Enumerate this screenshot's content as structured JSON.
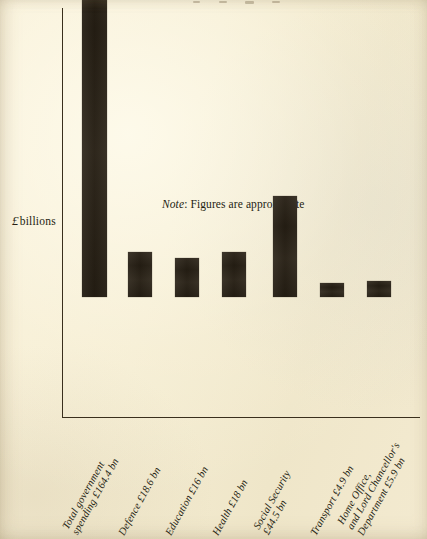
{
  "chart_data": {
    "type": "bar",
    "title": "",
    "xlabel": "",
    "ylabel": "£ billions",
    "ylim": [
      0,
      180
    ],
    "grid": false,
    "legend": "none",
    "note": "Figures are approximate",
    "note_prefix": "Note",
    "currency_symbol": "£",
    "unit": "bn",
    "categories": [
      "Total government spending",
      "Defence",
      "Education",
      "Health",
      "Social Security",
      "Transport",
      "Home Office, and Lord Chancellor's Department"
    ],
    "values": [
      164.4,
      18.6,
      16,
      18,
      44.5,
      4.9,
      5.9
    ],
    "value_labels": [
      "£164.4 bn",
      "£18.6 bn",
      "£16 bn",
      "£18 bn",
      "£44.5 bn",
      "£4.9 bn",
      "£5.9 bn"
    ],
    "bars": [
      {
        "name": "total-government-spending",
        "value": 164.4,
        "label_lines": [
          "Total government",
          "spending £164.4 bn"
        ],
        "left_px": 82,
        "width_px": 25,
        "height_px": 383
      },
      {
        "name": "defence",
        "value": 18.6,
        "label_lines": [
          "Defence £18.6 bn"
        ],
        "left_px": 128,
        "width_px": 24,
        "height_px": 45
      },
      {
        "name": "education",
        "value": 16,
        "label_lines": [
          "Education £16 bn"
        ],
        "left_px": 175,
        "width_px": 24,
        "height_px": 39
      },
      {
        "name": "health",
        "value": 18,
        "label_lines": [
          "Health £18 bn"
        ],
        "left_px": 222,
        "width_px": 24,
        "height_px": 45
      },
      {
        "name": "social-security",
        "value": 44.5,
        "label_lines": [
          "Social Security",
          "£44.5 bn"
        ],
        "left_px": 273,
        "width_px": 24,
        "height_px": 101
      },
      {
        "name": "transport",
        "value": 4.9,
        "label_lines": [
          "Transport £4.9 bn"
        ],
        "left_px": 320,
        "width_px": 24,
        "height_px": 14
      },
      {
        "name": "home-office-and-lord-chancellors-department",
        "value": 5.9,
        "label_lines": [
          "Home Office,",
          "and Lord Chancellor's",
          "Department £5.9 bn"
        ],
        "left_px": 367,
        "width_px": 24,
        "height_px": 16
      }
    ],
    "colors": {
      "background": "#f6eed4",
      "bar": "#2a2216",
      "axis": "#3a2f1d",
      "text": "#241d12"
    }
  },
  "axis": {
    "y_title_symbol": "£",
    "y_title_text": "billions"
  }
}
